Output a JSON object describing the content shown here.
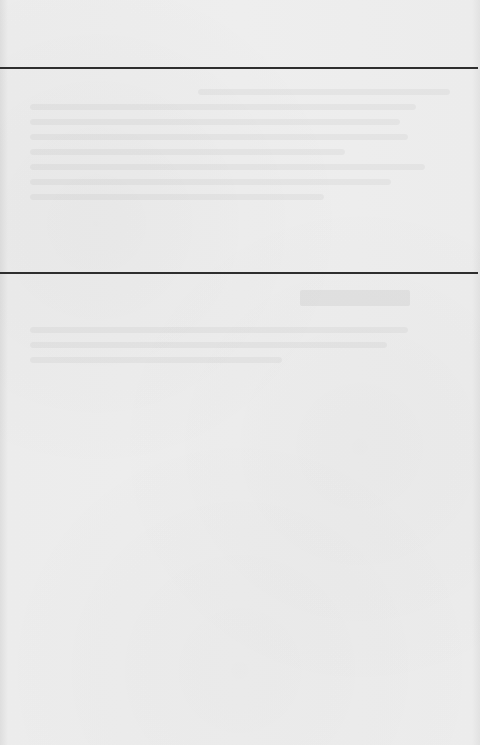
{
  "page": {
    "type": "blank paper page with horizontal rules",
    "background_color": "#ececec",
    "rule_color": "#2e2e2e",
    "rules": [
      {
        "name": "top-rule",
        "y": 67
      },
      {
        "name": "middle-rule",
        "y": 272
      }
    ],
    "visible_text": []
  }
}
